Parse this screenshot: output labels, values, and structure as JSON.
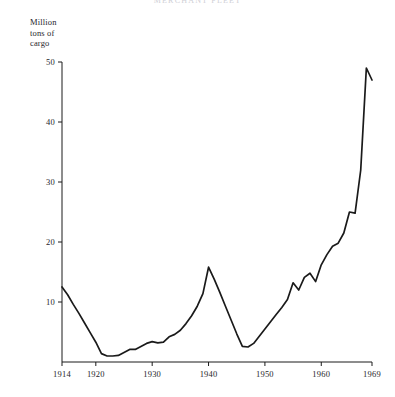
{
  "title": "MERCHANT FLEET",
  "axis_title_lines": [
    "Million",
    "tons of",
    "cargo"
  ],
  "chart_data": {
    "type": "line",
    "title": "MERCHANT FLEET",
    "xlabel": "",
    "ylabel": "Million tons of cargo",
    "xlim": [
      1914,
      1969
    ],
    "ylim": [
      0,
      50
    ],
    "grid": false,
    "legend": null,
    "yticks": [
      10,
      20,
      30,
      40,
      50
    ],
    "xticks": [
      1914,
      1920,
      1930,
      1940,
      1950,
      1960,
      1969
    ],
    "xtick_labels": [
      "1914",
      "1920",
      "1930",
      "1940",
      "1950",
      "1960",
      "1969"
    ],
    "ytick_labels": [
      "10",
      "20",
      "30",
      "40",
      "50"
    ],
    "line_color": "#1a1a1a",
    "x": [
      1914,
      1915,
      1916,
      1917,
      1918,
      1919,
      1920,
      1921,
      1922,
      1923,
      1924,
      1925,
      1926,
      1927,
      1928,
      1929,
      1930,
      1931,
      1932,
      1933,
      1934,
      1935,
      1936,
      1937,
      1938,
      1939,
      1940,
      1941,
      1942,
      1943,
      1944,
      1945,
      1946,
      1947,
      1948,
      1949,
      1950,
      1951,
      1952,
      1953,
      1954,
      1955,
      1956,
      1957,
      1958,
      1959,
      1960,
      1961,
      1962,
      1963,
      1964,
      1965,
      1966,
      1967,
      1968,
      1969
    ],
    "y": [
      12.5,
      11.2,
      9.6,
      8.1,
      6.5,
      4.9,
      3.3,
      1.4,
      1.0,
      1.0,
      1.1,
      1.6,
      2.1,
      2.1,
      2.6,
      3.1,
      3.4,
      3.2,
      3.3,
      4.2,
      4.6,
      5.3,
      6.4,
      7.7,
      9.3,
      11.4,
      15.8,
      13.8,
      11.6,
      9.3,
      7.0,
      4.7,
      2.6,
      2.5,
      3.1,
      4.3,
      5.5,
      6.7,
      7.9,
      9.1,
      10.4,
      13.2,
      12.0,
      14.1,
      14.8,
      13.4,
      16.2,
      17.9,
      19.3,
      19.8,
      21.5,
      25.0,
      24.8,
      32.0,
      49.0,
      47.0
    ]
  }
}
